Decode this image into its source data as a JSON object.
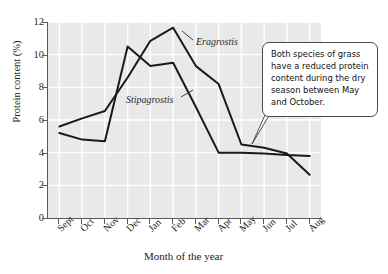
{
  "chart_data": {
    "type": "line",
    "title": "",
    "xlabel": "Month of the year",
    "ylabel": "Protein content (%)",
    "categories": [
      "Sept",
      "Oct",
      "Nov",
      "Dec",
      "Jan",
      "Feb",
      "Mar",
      "Apr",
      "May",
      "Jun",
      "Jul",
      "Aug"
    ],
    "ylim": [
      0,
      12
    ],
    "yticks": [
      0,
      2,
      4,
      6,
      8,
      10,
      12
    ],
    "grid": true,
    "legend_position": "inline-annotations",
    "series": [
      {
        "name": "Eragrostis",
        "values": [
          5.6,
          6.1,
          6.55,
          8.6,
          10.85,
          11.65,
          9.3,
          8.2,
          4.5,
          4.3,
          3.95,
          2.65
        ]
      },
      {
        "name": "Stipagrostis",
        "values": [
          5.2,
          4.8,
          4.7,
          10.5,
          9.3,
          9.5,
          6.8,
          4.0,
          4.0,
          3.95,
          3.85,
          3.8
        ]
      }
    ],
    "annotations": [
      {
        "id": "callout",
        "text": "Both species of grass have a reduced protein content during the dry season between May and October."
      }
    ]
  },
  "axis": {
    "y_title": "Protein content (%)",
    "x_title": "Month of the year",
    "y_tick_labels": [
      "0",
      "2",
      "4",
      "6",
      "8",
      "10",
      "12"
    ],
    "x_tick_labels": [
      "Sept",
      "Oct",
      "Nov",
      "Dec",
      "Jan",
      "Feb",
      "Mar",
      "Apr",
      "May",
      "Jun",
      "Jul",
      "Aug"
    ]
  },
  "series_labels": {
    "eragrostis": "Eragrostis",
    "stipagrostis": "Stipagrostis"
  },
  "callout": {
    "text": "Both species of grass have a reduced protein content during the dry season between May and October."
  },
  "colors": {
    "plot_background": "#e9e9e9",
    "gridline": "#ffffff",
    "axis": "#5a5a5a",
    "series_line": "#1a1a1a",
    "callout_border": "#4a4a4a",
    "callout_background": "#ffffff",
    "text": "#1c1c1c"
  }
}
